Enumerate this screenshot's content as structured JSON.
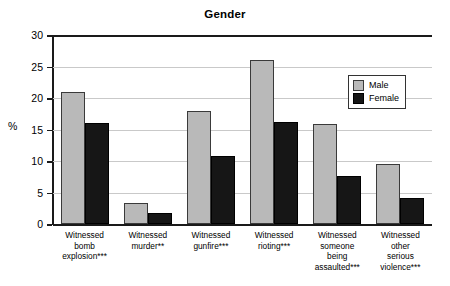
{
  "chart_data": {
    "type": "bar",
    "title": "Gender",
    "xlabel": "",
    "ylabel": "%",
    "ylim": [
      0,
      30
    ],
    "yticks": [
      0,
      5,
      10,
      15,
      20,
      25,
      30
    ],
    "grid": true,
    "legend_position": "upper right",
    "categories": [
      "Witnessed bomb explosion***",
      "Witnessed murder**",
      "Witnessed gunfire***",
      "Witnessed rioting***",
      "Witnessed someone being assaulted***",
      "Witnessed other serious violence***"
    ],
    "category_lines": [
      [
        "Witnessed",
        "bomb",
        "explosion***"
      ],
      [
        "Witnessed",
        "murder**"
      ],
      [
        "Witnessed",
        "gunfire***"
      ],
      [
        "Witnessed",
        "rioting***"
      ],
      [
        "Witnessed",
        "someone",
        "being",
        "assaulted***"
      ],
      [
        "Witnessed",
        "other",
        "serious",
        "violence***"
      ]
    ],
    "series": [
      {
        "name": "Male",
        "color": "#b9b9b9",
        "values": [
          21.0,
          3.4,
          18.0,
          26.1,
          15.9,
          9.5
        ]
      },
      {
        "name": "Female",
        "color": "#161616",
        "values": [
          16.0,
          1.8,
          10.8,
          16.2,
          7.7,
          4.1
        ]
      }
    ]
  },
  "legend": {
    "items": [
      {
        "label": "Male"
      },
      {
        "label": "Female"
      }
    ]
  },
  "colors": {
    "male": "#b9b9b9",
    "female": "#161616",
    "grid": "#c9c9c9",
    "axis": "#1a1a1a"
  }
}
